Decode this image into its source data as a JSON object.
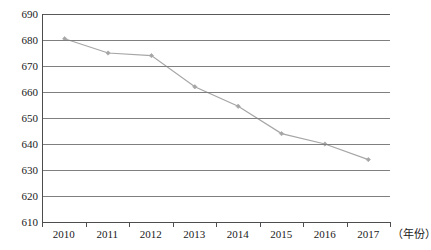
{
  "chart_data": {
    "type": "line",
    "title": "",
    "subtitle": "",
    "xlabel": "（年份）",
    "ylabel": "",
    "categories": [
      "2010",
      "2011",
      "2012",
      "2013",
      "2014",
      "2015",
      "2016",
      "2017"
    ],
    "values": [
      680.5,
      675.0,
      674.0,
      662.0,
      654.5,
      644.0,
      640.0,
      634.0
    ],
    "series": [
      {
        "name": "series-1",
        "values": [
          680.5,
          675.0,
          674.0,
          662.0,
          654.5,
          644.0,
          640.0,
          634.0
        ]
      }
    ],
    "ylim": [
      610,
      690
    ],
    "ytick_step": 10,
    "yticks": [
      690,
      680,
      670,
      660,
      650,
      640,
      630,
      620,
      610
    ],
    "xticks": [
      "2010",
      "2011",
      "2012",
      "2013",
      "2014",
      "2015",
      "2016",
      "2017"
    ],
    "grid": true,
    "grid_axis": "y",
    "legend": false,
    "legend_position": "none",
    "line_color": "#a6a6a6",
    "marker_color": "#a6a6a6",
    "grid_color": "#7f7f7f",
    "axis_color": "#4d4d4d",
    "text_color": "#1a1a1a",
    "background": "#ffffff",
    "marker": "diamond",
    "annotations": []
  },
  "axis": {
    "x_title": "（年份）"
  }
}
